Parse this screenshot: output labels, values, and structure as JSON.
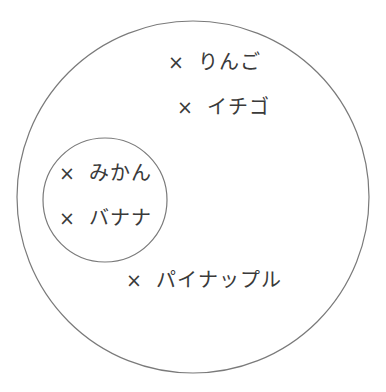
{
  "diagram": {
    "type": "euler-diagram",
    "style": {
      "line_color": "#7a7a7a",
      "text_color": "#3a3a3a",
      "background": "#ffffff"
    },
    "outer_set": {
      "shape": "circle",
      "cx": 193,
      "cy": 197,
      "r": 176,
      "members": [
        "りんご",
        "イチゴ",
        "パイナップル"
      ]
    },
    "inner_set": {
      "shape": "circle",
      "cx": 105,
      "cy": 200,
      "r": 62,
      "members": [
        "みかん",
        "バナナ"
      ]
    },
    "marker_symbol": "×",
    "items": [
      {
        "mark": "×",
        "label": "りんご",
        "x": 168,
        "y": 62,
        "set": "outer"
      },
      {
        "mark": "×",
        "label": "イチゴ",
        "x": 177,
        "y": 107,
        "set": "outer"
      },
      {
        "mark": "×",
        "label": "みかん",
        "x": 59,
        "y": 173,
        "set": "inner"
      },
      {
        "mark": "×",
        "label": "バナナ",
        "x": 59,
        "y": 218,
        "set": "inner"
      },
      {
        "mark": "×",
        "label": "パイナップル",
        "x": 126,
        "y": 280,
        "set": "outer"
      }
    ]
  }
}
